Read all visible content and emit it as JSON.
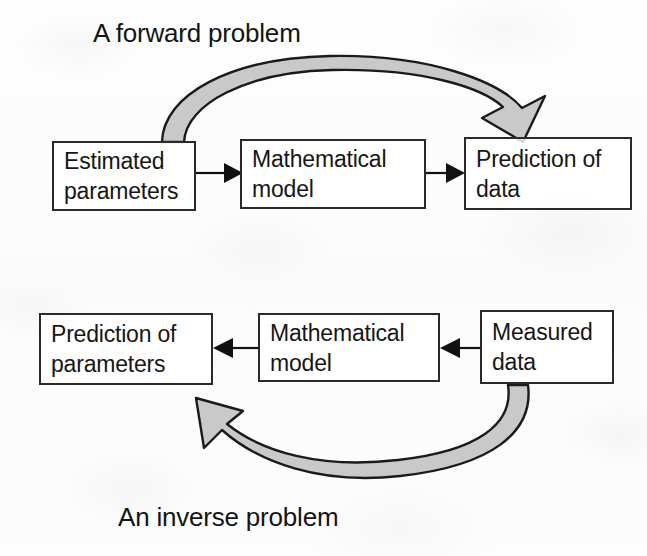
{
  "figure": {
    "title_top": "A forward problem",
    "title_bottom": "An inverse problem",
    "background_color": "#fdfdfd",
    "box_border_color": "#2a2a2a",
    "text_color": "#161616",
    "curved_arrow_fill": "#c9c9c9",
    "curved_arrow_stroke": "#1a1a1a",
    "straight_arrow_color": "#111111"
  },
  "forward_flow": {
    "label": "A forward problem",
    "nodes": [
      {
        "id": "estimated-parameters",
        "line1": "Estimated",
        "line2": "parameters"
      },
      {
        "id": "mathematical-model-top",
        "line1": "Mathematical",
        "line2": "model"
      },
      {
        "id": "prediction-of-data",
        "line1": "Prediction of",
        "line2": "data"
      }
    ],
    "connectors": [
      {
        "id": "arrow-estimated-to-model",
        "direction": "right"
      },
      {
        "id": "arrow-model-to-prediction",
        "direction": "right"
      },
      {
        "id": "curved-arrow-forward",
        "direction": "left-to-right-over-top",
        "from": "estimated-parameters",
        "to": "prediction-of-data"
      }
    ]
  },
  "inverse_flow": {
    "label": "An inverse problem",
    "nodes": [
      {
        "id": "prediction-of-parameters",
        "line1": "Prediction of",
        "line2": "parameters"
      },
      {
        "id": "mathematical-model-bottom",
        "line1": "Mathematical",
        "line2": "model"
      },
      {
        "id": "measured-data",
        "line1": "Measured",
        "line2": "data"
      }
    ],
    "connectors": [
      {
        "id": "arrow-model-to-parameters",
        "direction": "left"
      },
      {
        "id": "arrow-measured-to-model",
        "direction": "left"
      },
      {
        "id": "curved-arrow-inverse",
        "direction": "right-to-left-under-bottom",
        "from": "measured-data",
        "to": "prediction-of-parameters"
      }
    ]
  }
}
